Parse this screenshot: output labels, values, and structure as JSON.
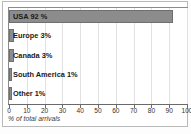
{
  "chart_data": {
    "type": "bar",
    "orientation": "horizontal",
    "title": "",
    "xlabel": "% of total arrivals",
    "ylabel": "",
    "xlim": [
      0,
      100
    ],
    "xticks": [
      0,
      10,
      20,
      30,
      40,
      50,
      60,
      70,
      80,
      90,
      100
    ],
    "xtick_labels": [
      "0",
      "10",
      "20",
      "30",
      "40",
      "50",
      "60",
      "70",
      "80",
      "90",
      "100"
    ],
    "grid": true,
    "legend": false,
    "categories": [
      "USA",
      "Europe",
      "Canada",
      "South America",
      "Other"
    ],
    "values": [
      92,
      3,
      3,
      1,
      1
    ],
    "bar_labels": [
      "USA 92 %",
      "Europe 3%",
      "Canada 3%",
      "South America 1%",
      "Other 1%"
    ],
    "bar_color": "#8c8c8c",
    "bar_edge_color": "#6f6f6f",
    "plot_background": "#ffffff",
    "frame_color": "#b9b9b9"
  }
}
